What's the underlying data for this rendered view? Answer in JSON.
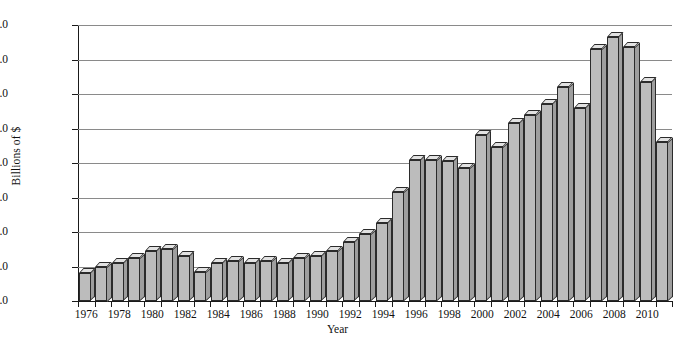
{
  "chart_data": {
    "type": "bar",
    "title": "",
    "xlabel": "Year",
    "ylabel": "Billions of $",
    "ylim": [
      0.0,
      16.0
    ],
    "ytick_labels": [
      "$0.0",
      "$2.0",
      "$4.0",
      "$6.0",
      "$8.0",
      "$10.0",
      "$12.0",
      "$14.0",
      "$16.0"
    ],
    "ytick_values": [
      0.0,
      2.0,
      4.0,
      6.0,
      8.0,
      10.0,
      12.0,
      14.0,
      16.0
    ],
    "xtick_labels": [
      "1976",
      "1978",
      "1980",
      "1982",
      "1984",
      "1986",
      "1988",
      "1990",
      "1992",
      "1994",
      "1996",
      "1998",
      "2000",
      "2002",
      "2004",
      "2006",
      "2008",
      "2010"
    ],
    "grid": true,
    "legend": false,
    "bar_style": "3d-extruded",
    "categories": [
      "1976",
      "1977",
      "1978",
      "1979",
      "1980",
      "1981",
      "1982",
      "1983",
      "1984",
      "1985",
      "1986",
      "1987",
      "1988",
      "1989",
      "1990",
      "1991",
      "1992",
      "1993",
      "1994",
      "1995",
      "1996",
      "1997",
      "1998",
      "1999",
      "2000",
      "2001",
      "2002",
      "2003",
      "2004",
      "2005",
      "2006",
      "2007",
      "2008",
      "2009",
      "2010",
      "2011"
    ],
    "values": [
      1.6,
      2.0,
      2.2,
      2.5,
      2.9,
      3.0,
      2.6,
      1.7,
      2.2,
      2.3,
      2.2,
      2.3,
      2.2,
      2.5,
      2.6,
      2.9,
      3.4,
      3.9,
      4.5,
      6.3,
      8.2,
      8.2,
      8.1,
      7.7,
      9.6,
      8.9,
      10.3,
      10.8,
      11.4,
      12.4,
      11.2,
      14.6,
      15.3,
      14.7,
      12.7,
      9.2
    ],
    "value_note_last": 9.7,
    "colors": {
      "bar_face": "#bcbcbc",
      "bar_top": "#e2e2e2",
      "bar_side": "#9e9e9e",
      "bar_edge": "#2b2b2b",
      "grid": "#8a8a8a",
      "axis": "#1a1a1a",
      "background": "#ffffff",
      "text": "#111111"
    }
  }
}
